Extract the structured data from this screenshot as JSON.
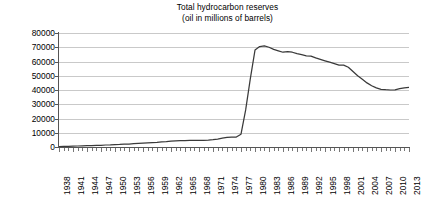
{
  "chart_data": {
    "type": "line",
    "title": "Total hydrocarbon reserves",
    "subtitle": "(oil in millions of barrels)",
    "xlabel": "",
    "ylabel": "",
    "ylim": [
      0,
      80000
    ],
    "ytick_step": 10000,
    "yticks": [
      0,
      10000,
      20000,
      30000,
      40000,
      50000,
      60000,
      70000,
      80000
    ],
    "ytick_labels": [
      "0",
      "10000",
      "20000",
      "30000",
      "40000",
      "50000",
      "60000",
      "70000",
      "80000"
    ],
    "xlim": [
      1938,
      2013
    ],
    "xtick_step": 3,
    "xtick_labels": [
      "1938",
      "1941",
      "1944",
      "1947",
      "1950",
      "1953",
      "1956",
      "1959",
      "1962",
      "1965",
      "1968",
      "1971",
      "1974",
      "1977",
      "1980",
      "1983",
      "1986",
      "1989",
      "1992",
      "1995",
      "1998",
      "2001",
      "2004",
      "2007",
      "2010",
      "2013"
    ],
    "grid": "horizontal",
    "legend": "none",
    "series_color": "#3a3a3a",
    "gridline_color": "#c9c9c9",
    "axis_color": "#555555",
    "x": [
      1938,
      1939,
      1940,
      1941,
      1942,
      1943,
      1944,
      1945,
      1946,
      1947,
      1948,
      1949,
      1950,
      1951,
      1952,
      1953,
      1954,
      1955,
      1956,
      1957,
      1958,
      1959,
      1960,
      1961,
      1962,
      1963,
      1964,
      1965,
      1966,
      1967,
      1968,
      1969,
      1970,
      1971,
      1972,
      1973,
      1974,
      1975,
      1976,
      1977,
      1978,
      1979,
      1980,
      1981,
      1982,
      1983,
      1984,
      1985,
      1986,
      1987,
      1988,
      1989,
      1990,
      1991,
      1992,
      1993,
      1994,
      1995,
      1996,
      1997,
      1998,
      1999,
      2000,
      2001,
      2002,
      2003,
      2004,
      2005,
      2006,
      2007,
      2008,
      2009,
      2010,
      2011,
      2012,
      2013
    ],
    "values": [
      300,
      400,
      500,
      600,
      700,
      800,
      900,
      1000,
      1100,
      1200,
      1400,
      1500,
      1700,
      1800,
      2000,
      2100,
      2300,
      2500,
      2700,
      2900,
      3100,
      3300,
      3600,
      3800,
      4100,
      4300,
      4400,
      4500,
      4600,
      4600,
      4600,
      4700,
      4900,
      5200,
      5600,
      6200,
      6800,
      6900,
      7000,
      9000,
      26000,
      48000,
      68000,
      70500,
      71000,
      70000,
      68500,
      67500,
      66500,
      67000,
      66500,
      65500,
      64800,
      64000,
      63800,
      62500,
      61500,
      60500,
      59500,
      58500,
      57500,
      57500,
      56000,
      53000,
      50000,
      47500,
      45000,
      43000,
      41500,
      40500,
      40200,
      40000,
      40100,
      41000,
      41500,
      41800
    ]
  }
}
